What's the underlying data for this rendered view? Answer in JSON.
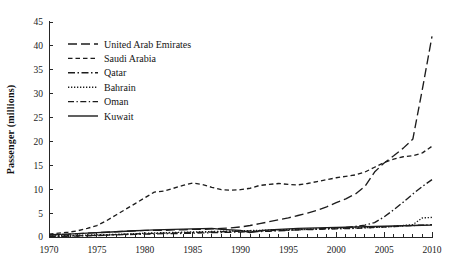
{
  "chart_data": {
    "type": "line",
    "title": "",
    "subtitle": "",
    "xlabel": "",
    "ylabel": "Passenger (millions)",
    "xlim": [
      1970,
      2010
    ],
    "ylim": [
      0,
      45
    ],
    "xticks": [
      1970,
      1975,
      1980,
      1985,
      1990,
      1995,
      2000,
      2005,
      2010
    ],
    "xticklabels": [
      "1970",
      "1975",
      "1980",
      "1985",
      "1990",
      "1995",
      "2000",
      "2005",
      "2010"
    ],
    "x_minor_tick_interval": 1,
    "yticks": [
      0,
      5,
      10,
      15,
      20,
      25,
      30,
      35,
      40,
      45
    ],
    "yticklabels": [
      "0",
      "5",
      "10",
      "15",
      "20",
      "25",
      "30",
      "35",
      "40",
      "45"
    ],
    "grid": false,
    "legend_position": "upper left",
    "x": [
      1970,
      1971,
      1972,
      1973,
      1974,
      1975,
      1976,
      1977,
      1978,
      1979,
      1980,
      1981,
      1982,
      1983,
      1984,
      1985,
      1986,
      1987,
      1988,
      1989,
      1990,
      1991,
      1992,
      1993,
      1994,
      1995,
      1996,
      1997,
      1998,
      1999,
      2000,
      2001,
      2002,
      2003,
      2004,
      2005,
      2006,
      2007,
      2008,
      2009,
      2010
    ],
    "series": [
      {
        "name": "United Arab Emirates",
        "linestyle": "long-dash",
        "dash_pattern": "9,4",
        "color": "#1c1c1c",
        "values": [
          0.4,
          0.5,
          0.6,
          0.7,
          0.8,
          0.9,
          1.0,
          1.1,
          1.2,
          1.3,
          1.4,
          1.4,
          1.4,
          1.5,
          1.5,
          1.6,
          1.6,
          1.7,
          1.8,
          1.9,
          2.1,
          2.4,
          2.8,
          3.2,
          3.6,
          4.0,
          4.5,
          5.0,
          5.6,
          6.3,
          7.2,
          8.0,
          9.0,
          10.6,
          13.6,
          15.5,
          17.0,
          18.6,
          20.5,
          31.0,
          42.0
        ]
      },
      {
        "name": "Saudi Arabia",
        "linestyle": "short-dash",
        "dash_pattern": "4.5,3",
        "color": "#1c1c1c",
        "values": [
          0.6,
          0.8,
          1.0,
          1.3,
          1.8,
          2.4,
          3.4,
          4.6,
          5.8,
          7.0,
          8.2,
          9.4,
          9.6,
          10.2,
          10.8,
          11.3,
          11.0,
          10.4,
          9.9,
          9.8,
          9.9,
          10.2,
          10.8,
          11.0,
          11.2,
          11.0,
          10.9,
          11.2,
          11.6,
          12.0,
          12.4,
          12.7,
          13.0,
          13.6,
          14.6,
          15.6,
          16.3,
          16.8,
          17.0,
          17.6,
          19.0
        ]
      },
      {
        "name": "Qatar",
        "linestyle": "dash-dot-dash",
        "dash_pattern": "7,2.5,1.5,2.5",
        "color": "#1c1c1c",
        "values": [
          0.15,
          0.18,
          0.2,
          0.25,
          0.3,
          0.35,
          0.4,
          0.45,
          0.5,
          0.55,
          0.6,
          0.65,
          0.7,
          0.72,
          0.75,
          0.8,
          0.85,
          0.9,
          0.95,
          1.0,
          1.05,
          1.1,
          1.15,
          1.2,
          1.3,
          1.4,
          1.5,
          1.6,
          1.7,
          1.8,
          1.9,
          2.0,
          2.2,
          2.5,
          3.0,
          4.2,
          5.7,
          7.3,
          9.0,
          10.6,
          12.0
        ]
      },
      {
        "name": "Bahrain",
        "linestyle": "dotted",
        "dash_pattern": "1.3,1.7",
        "color": "#1c1c1c",
        "values": [
          0.2,
          0.25,
          0.3,
          0.35,
          0.4,
          0.45,
          0.5,
          0.55,
          0.6,
          0.7,
          0.8,
          0.85,
          0.9,
          0.95,
          1.0,
          1.05,
          1.1,
          1.15,
          1.2,
          1.25,
          1.3,
          1.35,
          1.4,
          1.45,
          1.5,
          1.55,
          1.6,
          1.65,
          1.7,
          1.75,
          1.8,
          1.85,
          1.9,
          1.95,
          2.0,
          2.1,
          2.2,
          2.4,
          2.6,
          4.0,
          4.1
        ]
      },
      {
        "name": "Oman",
        "linestyle": "dash-dot",
        "dash_pattern": "6,2.5,1.3,2.5",
        "color": "#1c1c1c",
        "values": [
          0.1,
          0.12,
          0.15,
          0.2,
          0.25,
          0.3,
          0.4,
          0.5,
          0.6,
          0.65,
          0.7,
          0.75,
          0.8,
          0.85,
          0.9,
          0.95,
          1.0,
          1.05,
          1.1,
          1.15,
          1.2,
          1.25,
          1.3,
          1.35,
          1.4,
          1.45,
          1.5,
          1.55,
          1.6,
          1.65,
          1.7,
          1.75,
          1.8,
          1.9,
          2.0,
          2.1,
          2.2,
          2.3,
          2.4,
          2.5,
          2.6
        ]
      },
      {
        "name": "Kuwait",
        "linestyle": "solid",
        "dash_pattern": "",
        "color": "#1c1c1c",
        "values": [
          0.5,
          0.55,
          0.6,
          0.7,
          0.8,
          0.9,
          1.0,
          1.1,
          1.2,
          1.3,
          1.4,
          1.5,
          1.55,
          1.6,
          1.65,
          1.7,
          1.75,
          1.8,
          1.6,
          1.5,
          1.4,
          0.9,
          1.3,
          1.5,
          1.6,
          1.7,
          1.8,
          1.85,
          1.9,
          1.95,
          2.0,
          2.05,
          2.1,
          2.15,
          2.2,
          2.25,
          2.3,
          2.35,
          2.4,
          2.45,
          2.5
        ]
      }
    ]
  },
  "legend": {
    "items": [
      {
        "label": "United Arab Emirates"
      },
      {
        "label": "Saudi Arabia"
      },
      {
        "label": "Qatar"
      },
      {
        "label": "Bahrain"
      },
      {
        "label": "Oman"
      },
      {
        "label": "Kuwait"
      }
    ]
  }
}
